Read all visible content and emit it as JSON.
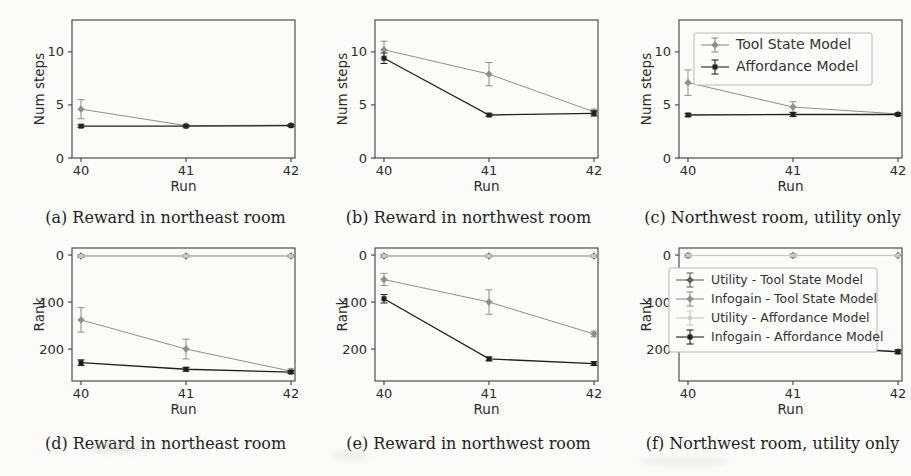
{
  "figure": {
    "background": "#fbfbf9",
    "axis_color": "#3f3f3f",
    "tick_label_color": "#2b2b2b",
    "caption_color": "#1e1e1e"
  },
  "colors": {
    "tool_state_model": "#8f8f8f",
    "affordance_model": "#222222",
    "utility_tool_state": "#5f5f5f",
    "infogain_tool_state": "#8f8f8f",
    "utility_affordance": "#c9c9c9",
    "infogain_affordance": "#1f1f1f"
  },
  "chart_data": [
    {
      "id": "a",
      "type": "line",
      "caption": "(a) Reward in northeast room",
      "xlabel": "Run",
      "ylabel": "Num steps",
      "x": [
        40,
        41,
        42
      ],
      "xticks": [
        40,
        41,
        42
      ],
      "yticks": [
        0,
        5,
        10
      ],
      "ylim": [
        0,
        13
      ],
      "y_inverted": false,
      "legend": {
        "show": false,
        "position": ""
      },
      "series": [
        {
          "name": "Tool State Model",
          "color": "#8f8f8f",
          "marker": "diamond",
          "line_width": 1.0,
          "values": [
            4.6,
            3.05,
            3.1
          ],
          "errors": [
            0.9,
            0.1,
            0.1
          ]
        },
        {
          "name": "Affordance Model",
          "color": "#222222",
          "marker": "square",
          "line_width": 1.3,
          "values": [
            3.0,
            3.0,
            3.05
          ],
          "errors": [
            0.12,
            0.08,
            0.08
          ]
        }
      ]
    },
    {
      "id": "b",
      "type": "line",
      "caption": "(b) Reward in northwest room",
      "xlabel": "Run",
      "ylabel": "Num steps",
      "x": [
        40,
        41,
        42
      ],
      "xticks": [
        40,
        41,
        42
      ],
      "yticks": [
        0,
        5,
        10
      ],
      "ylim": [
        0,
        13
      ],
      "y_inverted": false,
      "legend": {
        "show": false,
        "position": ""
      },
      "series": [
        {
          "name": "Tool State Model",
          "color": "#8f8f8f",
          "marker": "diamond",
          "line_width": 1.0,
          "values": [
            10.2,
            7.9,
            4.35
          ],
          "errors": [
            0.8,
            1.1,
            0.25
          ]
        },
        {
          "name": "Affordance Model",
          "color": "#222222",
          "marker": "square",
          "line_width": 1.3,
          "values": [
            9.4,
            4.05,
            4.2
          ],
          "errors": [
            0.5,
            0.12,
            0.25
          ]
        }
      ]
    },
    {
      "id": "c",
      "type": "line",
      "caption": "(c) Northwest room, utility only",
      "xlabel": "Run",
      "ylabel": "Num steps",
      "x": [
        40,
        41,
        42
      ],
      "xticks": [
        40,
        41,
        42
      ],
      "yticks": [
        0,
        5,
        10
      ],
      "ylim": [
        0,
        13
      ],
      "y_inverted": false,
      "legend": {
        "show": true,
        "position": "top-right"
      },
      "series": [
        {
          "name": "Tool State Model",
          "color": "#8f8f8f",
          "marker": "diamond",
          "line_width": 1.0,
          "values": [
            7.1,
            4.8,
            4.15
          ],
          "errors": [
            1.2,
            0.5,
            0.12
          ]
        },
        {
          "name": "Affordance Model",
          "color": "#222222",
          "marker": "square",
          "line_width": 1.3,
          "values": [
            4.05,
            4.1,
            4.1
          ],
          "errors": [
            0.15,
            0.2,
            0.1
          ]
        }
      ]
    },
    {
      "id": "d",
      "type": "line",
      "caption": "(d) Reward in northeast room",
      "xlabel": "Run",
      "ylabel": "Rank",
      "x": [
        40,
        41,
        42
      ],
      "xticks": [
        40,
        41,
        42
      ],
      "yticks": [
        0,
        100,
        200
      ],
      "ylim": [
        -15,
        268
      ],
      "y_inverted": true,
      "legend": {
        "show": false,
        "position": ""
      },
      "series": [
        {
          "name": "Utility - Tool State Model",
          "color": "#5f5f5f",
          "marker": "diamond",
          "line_width": 0.9,
          "values": [
            2,
            2,
            2
          ],
          "errors": [
            3,
            2,
            2
          ]
        },
        {
          "name": "Infogain - Tool State Model",
          "color": "#8f8f8f",
          "marker": "diamond",
          "line_width": 1.0,
          "values": [
            138,
            200,
            247
          ],
          "errors": [
            26,
            21,
            5
          ]
        },
        {
          "name": "Utility - Affordance Model",
          "color": "#c9c9c9",
          "marker": "circle",
          "line_width": 1.0,
          "values": [
            2,
            2,
            2
          ],
          "errors": [
            2,
            2,
            2
          ]
        },
        {
          "name": "Infogain - Affordance Model",
          "color": "#1f1f1f",
          "marker": "square",
          "line_width": 1.3,
          "values": [
            229,
            243,
            249
          ],
          "errors": [
            6,
            4,
            3
          ]
        }
      ]
    },
    {
      "id": "e",
      "type": "line",
      "caption": "(e) Reward in northwest room",
      "xlabel": "Run",
      "ylabel": "Rank",
      "x": [
        40,
        41,
        42
      ],
      "xticks": [
        40,
        41,
        42
      ],
      "yticks": [
        0,
        100,
        200
      ],
      "ylim": [
        -15,
        268
      ],
      "y_inverted": true,
      "legend": {
        "show": false,
        "position": ""
      },
      "series": [
        {
          "name": "Utility - Tool State Model",
          "color": "#5f5f5f",
          "marker": "diamond",
          "line_width": 0.9,
          "values": [
            2,
            2,
            2
          ],
          "errors": [
            3,
            2,
            2
          ]
        },
        {
          "name": "Infogain - Tool State Model",
          "color": "#8f8f8f",
          "marker": "diamond",
          "line_width": 1.0,
          "values": [
            52,
            100,
            168
          ],
          "errors": [
            13,
            26,
            6
          ]
        },
        {
          "name": "Utility - Affordance Model",
          "color": "#c9c9c9",
          "marker": "circle",
          "line_width": 1.0,
          "values": [
            2,
            2,
            2
          ],
          "errors": [
            2,
            2,
            2
          ]
        },
        {
          "name": "Infogain - Affordance Model",
          "color": "#1f1f1f",
          "marker": "square",
          "line_width": 1.3,
          "values": [
            93,
            221,
            231
          ],
          "errors": [
            9,
            4,
            4
          ]
        }
      ]
    },
    {
      "id": "f",
      "type": "line",
      "caption": "(f) Northwest room, utility only",
      "xlabel": "Run",
      "ylabel": "Rank",
      "x": [
        40,
        41,
        42
      ],
      "xticks": [
        40,
        41,
        42
      ],
      "yticks": [
        0,
        100,
        200
      ],
      "ylim": [
        -15,
        268
      ],
      "y_inverted": true,
      "legend": {
        "show": true,
        "position": "upper-mid"
      },
      "series": [
        {
          "name": "Utility - Tool State Model",
          "color": "#5f5f5f",
          "marker": "diamond",
          "line_width": 0.9,
          "values": [
            1,
            1,
            1
          ],
          "errors": [
            3,
            3,
            2
          ]
        },
        {
          "name": "Infogain - Tool State Model",
          "color": "#8f8f8f",
          "marker": "diamond",
          "line_width": 1.0,
          "values": [
            171,
            191,
            205
          ],
          "errors": [
            9,
            8,
            4
          ]
        },
        {
          "name": "Utility - Affordance Model",
          "color": "#c9c9c9",
          "marker": "circle",
          "line_width": 1.0,
          "values": [
            1,
            1,
            1
          ],
          "errors": [
            2,
            2,
            2
          ]
        },
        {
          "name": "Infogain - Affordance Model",
          "color": "#1f1f1f",
          "marker": "square",
          "line_width": 1.3,
          "values": [
            180,
            193,
            206
          ],
          "errors": [
            13,
            10,
            4
          ]
        }
      ]
    }
  ]
}
